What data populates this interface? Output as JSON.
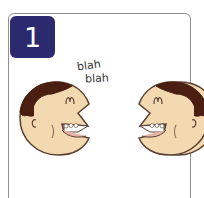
{
  "card": {
    "step_number": "1",
    "speech": [
      "blah",
      "blah"
    ]
  },
  "colors": {
    "badge": "#2b2a6e",
    "skin": "#f2d9b0",
    "hair": "#4a1f12",
    "outline": "#5a4030",
    "border": "#8f8f8f"
  },
  "illustration": {
    "description": "Two cartoon faces facing each other talking"
  }
}
